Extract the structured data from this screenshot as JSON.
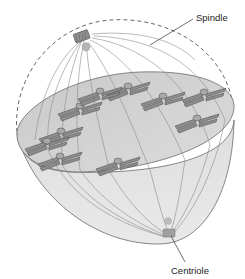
{
  "diagram": {
    "labels": {
      "spindle": "Spindle",
      "centriole": "Centriole"
    },
    "colors": {
      "background": "#ffffff",
      "cell_fill": "#e4e4e4",
      "cell_cut_face": "#d4d4d4",
      "outline": "#6a6a6a",
      "spindle_fiber": "#8a8a8a",
      "chromosome": "#8c8c8c",
      "chromosome_edge": "#4a4a4a",
      "centriole": "#9a9a9a",
      "text": "#222222"
    },
    "components": {
      "cell_outline_upper": "dashed",
      "metaphase_plate_chromosomes": 10,
      "poles": 2
    }
  }
}
